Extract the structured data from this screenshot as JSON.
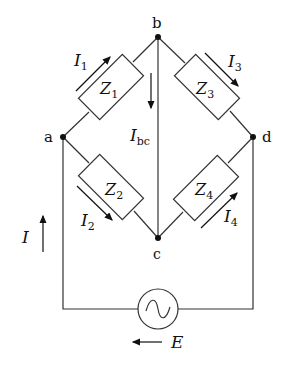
{
  "nodes": {
    "a": {
      "label": "a",
      "x": 63,
      "y": 137
    },
    "b": {
      "label": "b",
      "x": 158,
      "y": 37
    },
    "c": {
      "label": "c",
      "x": 158,
      "y": 238
    },
    "d": {
      "label": "d",
      "x": 253,
      "y": 137
    }
  },
  "impedances": [
    {
      "id": "Z1",
      "label": "Z",
      "sub": "1"
    },
    {
      "id": "Z2",
      "label": "Z",
      "sub": "2"
    },
    {
      "id": "Z3",
      "label": "Z",
      "sub": "3"
    },
    {
      "id": "Z4",
      "label": "Z",
      "sub": "4"
    }
  ],
  "currents": {
    "I1": {
      "label": "I",
      "sub": "1"
    },
    "I2": {
      "label": "I",
      "sub": "2"
    },
    "I3": {
      "label": "I",
      "sub": "3"
    },
    "I4": {
      "label": "I",
      "sub": "4"
    },
    "Ibc": {
      "label": "I",
      "sub": "bc"
    },
    "I": {
      "label": "I"
    }
  },
  "source": {
    "label": "E",
    "symbol": "~"
  },
  "colors": {
    "stroke": "#333333",
    "node": "#111111",
    "background": "#ffffff"
  }
}
